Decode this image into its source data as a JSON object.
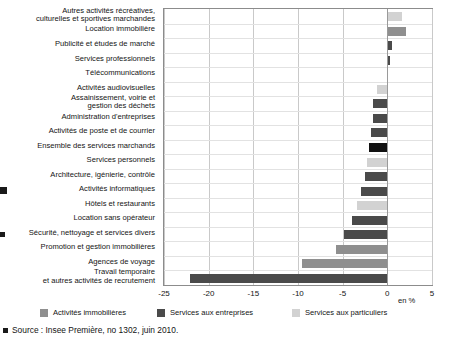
{
  "chart_data": {
    "type": "bar",
    "orientation": "horizontal",
    "title": "",
    "xlabel": "en %",
    "ylabel": "",
    "xlim": [
      -25,
      5
    ],
    "xticks": [
      -25,
      -20,
      -15,
      -10,
      -5,
      0,
      5
    ],
    "xticklabels": [
      "-25",
      "-20",
      "-15",
      "-10",
      "-5",
      "0",
      "5"
    ],
    "grid": true,
    "legend_position": "bottom",
    "categories": [
      "Autres activités récréatives,\nculturelles et sportives marchandes",
      "Location immobilière",
      "Publicité et études de marché",
      "Services professionnels",
      "Télécommunications",
      "Activités audiovisuelles",
      "Assainissement, voirie et\ngestion des déchets",
      "Administration d'entreprises",
      "Activités de poste et de courrier",
      "Ensemble des services marchands",
      "Services personnels",
      "Architecture, igénierie, contrôle",
      "Activités informatiques",
      "Hôtels et restaurants",
      "Location sans opérateur",
      "Sécurité, nettoyage et services divers",
      "Promotion et gestion immobilières",
      "Agences de voyage",
      "Travail temporaire\net autres activités de recrutement"
    ],
    "values": [
      1.6,
      2.1,
      0.5,
      0.25,
      0.0,
      -1.2,
      -1.6,
      -1.6,
      -1.8,
      -2.0,
      -2.3,
      -2.5,
      -2.9,
      -3.4,
      -3.9,
      -4.8,
      -5.7,
      -9.6,
      -22.1
    ],
    "series_of": [
      "particuliers",
      "immobilieres",
      "entreprises",
      "entreprises",
      "entreprises",
      "particuliers",
      "entreprises",
      "entreprises",
      "entreprises",
      "ensemble",
      "particuliers",
      "entreprises",
      "entreprises",
      "particuliers",
      "entreprises",
      "entreprises",
      "immobilieres",
      "immobilieres",
      "entreprises"
    ]
  },
  "colors": {
    "immobilieres": "#8f8f8f",
    "entreprises": "#4a4a4a",
    "particuliers": "#d2d2d2",
    "ensemble": "#111111"
  },
  "legend": {
    "items": [
      {
        "label": "Activités immobilières",
        "key": "immobilieres"
      },
      {
        "label": "Services aux entreprises",
        "key": "entreprises"
      },
      {
        "label": "Services aux particuliers",
        "key": "particuliers"
      }
    ]
  },
  "axis": {
    "unit": "en %"
  },
  "source": {
    "text": "Source : Insee Première, no 1302, juin 2010."
  }
}
